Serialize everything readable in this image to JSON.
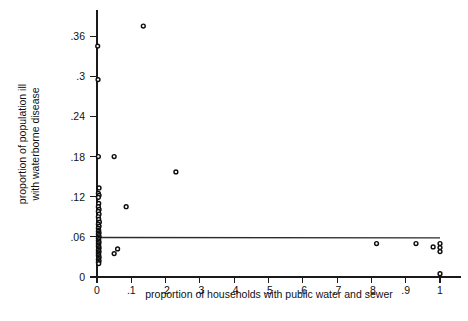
{
  "figure": {
    "title": "",
    "background_color": "#ffffff",
    "point_color": "#0d0d0d",
    "line_color": "#2b2b2b"
  },
  "axes": {
    "x": {
      "label": "proportion of households with public water and sewer",
      "ticks": [
        "0",
        ".1",
        ".2",
        ".3",
        ".4",
        ".5",
        ".6",
        ".7",
        ".8",
        ".9",
        "1"
      ],
      "tick_values": [
        0,
        0.1,
        0.2,
        0.3,
        0.4,
        0.5,
        0.6,
        0.7,
        0.8,
        0.9,
        1
      ],
      "min": 0,
      "max": 1
    },
    "y": {
      "label_line1": "proportion of population ill",
      "label_line2": "with waterborne disease",
      "ticks": [
        "0",
        ".06",
        ".12",
        ".18",
        ".24",
        ".3",
        ".36"
      ],
      "tick_values": [
        0,
        0.06,
        0.12,
        0.18,
        0.24,
        0.3,
        0.36
      ],
      "min": 0,
      "max": 0.39
    }
  },
  "chart_data": {
    "type": "scatter",
    "title": "",
    "xlabel": "proportion of households with public water and sewer",
    "ylabel": "proportion of population ill with waterborne disease",
    "xlim": [
      0,
      1
    ],
    "ylim": [
      0,
      0.39
    ],
    "grid": false,
    "legend": null,
    "marker": "open-circle",
    "x": [
      0.002,
      0.135,
      0.003,
      0.004,
      0.05,
      0.006,
      0.004,
      0.006,
      0.004,
      0.005,
      0.004,
      0.006,
      0.004,
      0.006,
      0.004,
      0.005,
      0.007,
      0.004,
      0.006,
      0.004,
      0.005,
      0.004,
      0.006,
      0.004,
      0.005,
      0.006,
      0.004,
      0.005,
      0.004,
      0.006,
      0.004,
      0.005,
      0.004,
      0.006,
      0.005,
      0.004,
      0.006,
      0.004,
      0.005,
      0.004,
      0.006,
      0.005,
      0.004,
      0.006,
      0.004,
      0.005,
      0.23,
      0.085,
      0.05,
      0.06,
      0.815,
      0.93,
      0.98,
      1.0,
      1.0,
      1.0,
      1.0
    ],
    "y": [
      0.345,
      0.375,
      0.295,
      0.18,
      0.18,
      0.133,
      0.125,
      0.122,
      0.119,
      0.11,
      0.105,
      0.101,
      0.098,
      0.094,
      0.09,
      0.086,
      0.082,
      0.079,
      0.076,
      0.073,
      0.07,
      0.068,
      0.066,
      0.064,
      0.062,
      0.06,
      0.058,
      0.056,
      0.054,
      0.052,
      0.05,
      0.048,
      0.046,
      0.044,
      0.042,
      0.04,
      0.038,
      0.036,
      0.034,
      0.032,
      0.03,
      0.028,
      0.026,
      0.024,
      0.022,
      0.02,
      0.157,
      0.105,
      0.035,
      0.042,
      0.05,
      0.05,
      0.045,
      0.05,
      0.044,
      0.038,
      0.005
    ],
    "fit_line": {
      "type": "linear",
      "x_start": 0.0,
      "x_end": 1.0,
      "y_start": 0.059,
      "y_end": 0.0585
    }
  }
}
